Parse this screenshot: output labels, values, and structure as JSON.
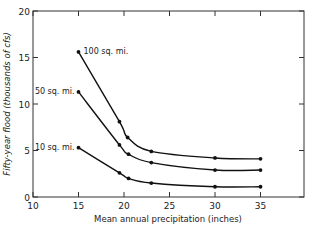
{
  "chart_data": {
    "type": "line",
    "title": "",
    "xlabel": "Mean annual precipitation (inches)",
    "ylabel": "Fifty-year flood (thousands of cfs)",
    "xlim": [
      10,
      38
    ],
    "ylim": [
      0,
      20
    ],
    "xticks": [
      10,
      15,
      20,
      25,
      30,
      35
    ],
    "yticks": [
      0,
      5,
      10,
      15,
      20
    ],
    "grid": false,
    "legend": "inline labels at curve starts",
    "series": [
      {
        "name": "100 sq. mi.",
        "x": [
          15,
          19.5,
          20.4,
          23,
          30,
          35
        ],
        "y": [
          15.6,
          8.1,
          6.4,
          4.9,
          4.2,
          4.1
        ]
      },
      {
        "name": "50 sq. mi.",
        "x": [
          15,
          19.5,
          20.5,
          23,
          30,
          35
        ],
        "y": [
          11.3,
          5.6,
          4.6,
          3.7,
          2.9,
          2.9
        ]
      },
      {
        "name": "10 sq. mi.",
        "x": [
          15,
          19.5,
          20.5,
          23,
          30,
          35
        ],
        "y": [
          5.3,
          2.6,
          2.0,
          1.5,
          1.1,
          1.1
        ]
      }
    ]
  }
}
